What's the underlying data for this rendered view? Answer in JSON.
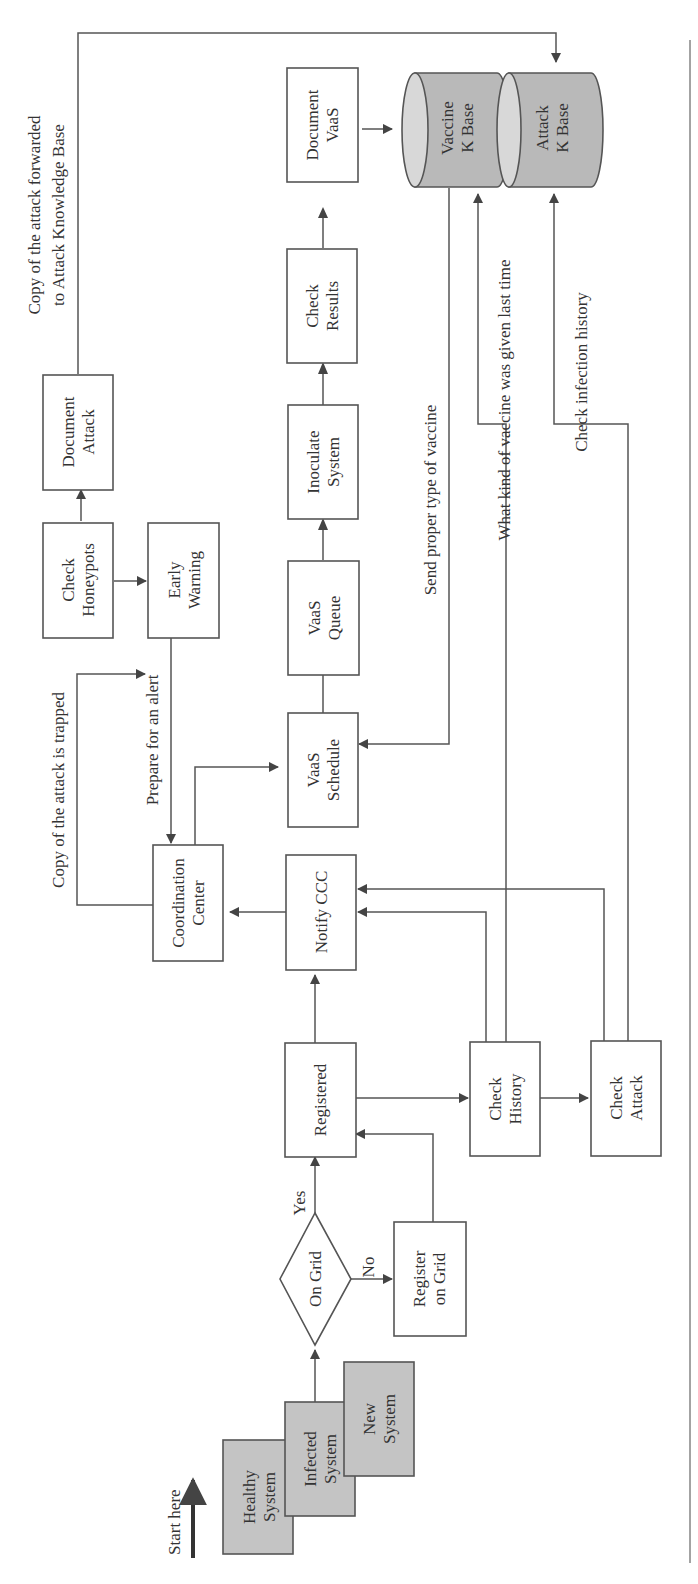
{
  "diagram": {
    "orientation": "rotated-90-ccw",
    "start_label": "Start here",
    "nodes": {
      "healthy_system": [
        "Healthy",
        "System"
      ],
      "infected_system": [
        "Infected",
        "System"
      ],
      "new_system": [
        "New",
        "System"
      ],
      "on_grid": "On Grid",
      "register_on_grid": [
        "Register",
        "on Grid"
      ],
      "registered": "Registered",
      "notify_ccc": "Notify CCC",
      "check_history": [
        "Check",
        "History"
      ],
      "check_attack": [
        "Check",
        "Attack"
      ],
      "coordination_center": [
        "Coordination",
        "Center"
      ],
      "check_honeypots": [
        "Check",
        "Honeypots"
      ],
      "early_warning": [
        "Early",
        "Warning"
      ],
      "document_attack": [
        "Document",
        "Attack"
      ],
      "vaas_schedule": [
        "VaaS",
        "Schedule"
      ],
      "vaas_queue": [
        "VaaS",
        "Queue"
      ],
      "inoculate_system": [
        "Inoculate",
        "System"
      ],
      "check_results": [
        "Check",
        "Results"
      ],
      "document_vaas": [
        "Document",
        "VaaS"
      ],
      "vaccine_kbase": [
        "Vaccine",
        "K Base"
      ],
      "attack_kbase": [
        "Attack",
        "K Base"
      ]
    },
    "edge_labels": {
      "yes": "Yes",
      "no": "No",
      "copy_trapped": "Copy of the attack is trapped",
      "prepare_alert": "Prepare for an alert",
      "copy_forwarded": [
        "Copy of the attack forwarded",
        "to Attack Knowledge Base"
      ],
      "send_vaccine": "Send proper type of vaccine",
      "what_vaccine": "What kind of vaccine was given last time",
      "check_infection": "Check infection history"
    },
    "colors": {
      "shaded_fill": "#c4c4c4",
      "database_fill": "#b9b9b9",
      "stroke": "#555555",
      "text": "#333333"
    }
  }
}
